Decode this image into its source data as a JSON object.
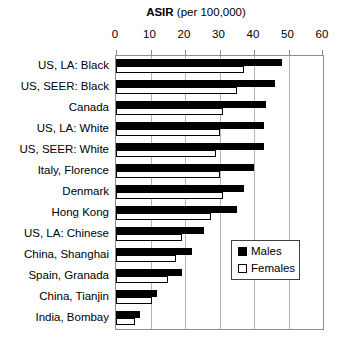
{
  "title": {
    "bold": "ASIR",
    "rest": " (per 100,000)"
  },
  "axis": {
    "ticks": [
      0,
      10,
      20,
      30,
      40,
      50,
      60
    ],
    "max": 60
  },
  "legend": {
    "items": [
      {
        "label": "Males",
        "fill": "#000000"
      },
      {
        "label": "Females",
        "fill": "#ffffff"
      }
    ]
  },
  "colors": {
    "males_bar": "#000000",
    "females_bar": "#ffffff",
    "bar_border": "#000000",
    "gridline": "#b3b3b3",
    "plot_border": "#8c8c8c",
    "text": "#000000",
    "background": "#ffffff"
  },
  "chart_data": {
    "type": "bar",
    "orientation": "horizontal",
    "title": "ASIR (per 100,000)",
    "xlabel": "ASIR (per 100,000)",
    "ylabel": "",
    "xlim": [
      0,
      60
    ],
    "grid": true,
    "legend_position": "inside-right",
    "categories": [
      "US, LA: Black",
      "US, SEER: Black",
      "Canada",
      "US, LA: White",
      "US, SEER: White",
      "Italy, Florence",
      "Denmark",
      "Hong Kong",
      "US, LA: Chinese",
      "China, Shanghai",
      "Spain, Granada",
      "China, Tianjin",
      "India, Bombay"
    ],
    "series": [
      {
        "name": "Males",
        "values": [
          48,
          46,
          43.5,
          43,
          43,
          40,
          37,
          35,
          25.5,
          22,
          19,
          12,
          7
        ]
      },
      {
        "name": "Females",
        "values": [
          37,
          35,
          31,
          30,
          29,
          30,
          31,
          27.5,
          19,
          17.5,
          15,
          10.5,
          5.5
        ]
      }
    ]
  }
}
